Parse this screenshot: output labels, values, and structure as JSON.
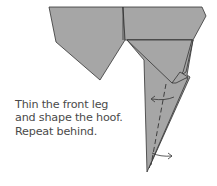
{
  "diagram": {
    "type": "origami-step",
    "caption_lines": [
      "Thin the front leg",
      "and shape the hoof.",
      "Repeat behind."
    ],
    "colors": {
      "paper_fill": "#a6a6a6",
      "line": "#333333",
      "text": "#4a4a4a"
    },
    "symbols": [
      "valley-fold-dashed-line",
      "fold-arrow-left",
      "fold-arrow-right"
    ]
  }
}
